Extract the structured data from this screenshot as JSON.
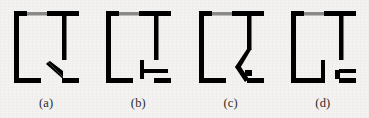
{
  "figure": {
    "background_color": "#f3f2f0",
    "wall_color": "#000000",
    "window_color": "#8a8a8a",
    "caption_color": "#2b2b2b",
    "panel_count": 4
  },
  "panels": [
    {
      "caption": "(a)",
      "door_state": "open-inward-angled",
      "door_icon": "door-leaf-triangular",
      "has_window": true,
      "window_label": "window-segment"
    },
    {
      "caption": "(b)",
      "door_state": "closed-folded",
      "door_icon": "door-leaf-horizontal-hinged",
      "has_window": true,
      "window_label": "window-segment"
    },
    {
      "caption": "(c)",
      "door_state": "open-outward-diagonal",
      "door_icon": "door-leaf-arrow",
      "has_window": true,
      "window_label": "window-segment"
    },
    {
      "caption": "(d)",
      "door_state": "closed-flush",
      "door_icon": "door-leaf-flat",
      "has_window": true,
      "window_label": "window-segment"
    }
  ]
}
